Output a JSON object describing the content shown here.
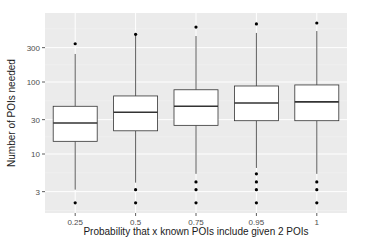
{
  "chart_data": {
    "type": "boxplot",
    "title": "",
    "xlabel": "Probability that x known POIs include given 2 POIs",
    "ylabel": "Number of POIs needed",
    "y_scale": "log10",
    "y_ticks": [
      3,
      10,
      30,
      100,
      300
    ],
    "y_tick_labels": [
      "3",
      "10",
      "30",
      "100",
      "300"
    ],
    "ylim": [
      1.8,
      900
    ],
    "grid": true,
    "legend": null,
    "categories": [
      "0.25",
      "0.5",
      "0.75",
      "0.95",
      "1"
    ],
    "boxes": [
      {
        "category": "0.25",
        "whisker_low": 3.2,
        "q1": 15,
        "median": 27,
        "q3": 46,
        "whisker_high": 245,
        "outliers": [
          2.1,
          340
        ]
      },
      {
        "category": "0.5",
        "whisker_low": 4,
        "q1": 21,
        "median": 38,
        "q3": 64,
        "whisker_high": 450,
        "outliers": [
          2.1,
          3.2,
          460
        ]
      },
      {
        "category": "0.75",
        "whisker_low": 5.3,
        "q1": 25,
        "median": 46,
        "q3": 78,
        "whisker_high": 435,
        "outliers": [
          2.1,
          3.2,
          4.1,
          580
        ]
      },
      {
        "category": "0.95",
        "whisker_low": 6.4,
        "q1": 29,
        "median": 51,
        "q3": 88,
        "whisker_high": 480,
        "outliers": [
          2.1,
          3.2,
          4.1,
          5.3,
          640
        ]
      },
      {
        "category": "1",
        "whisker_low": 5.3,
        "q1": 29,
        "median": 53,
        "q3": 91,
        "whisker_high": 510,
        "outliers": [
          2.1,
          3.2,
          4.1,
          660
        ]
      }
    ]
  },
  "colors": {
    "panel_background": "#ebebeb",
    "grid_major": "#ffffff",
    "box_fill": "#ffffff",
    "box_stroke": "#333333",
    "outlier": "#000000"
  }
}
